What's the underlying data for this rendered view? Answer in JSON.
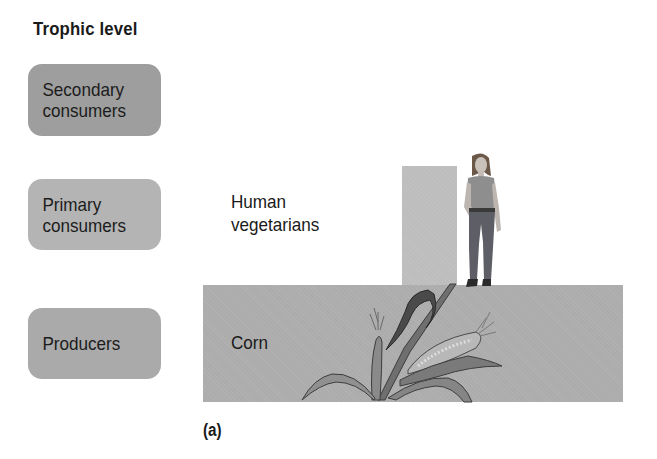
{
  "title": "Trophic level",
  "levels": [
    {
      "id": "secondary",
      "label": "Secondary consumers",
      "lines": [
        "Secondary",
        "consumers"
      ]
    },
    {
      "id": "primary",
      "label": "Primary consumers",
      "lines": [
        "Primary",
        "consumers"
      ]
    },
    {
      "id": "producers",
      "label": "Producers",
      "lines": [
        "Producers"
      ]
    }
  ],
  "pyramid": {
    "primary_consumers_label_lines": [
      "Human",
      "vegetarians"
    ],
    "producers_label": "Corn"
  },
  "panel_label": "(a)",
  "colors": {
    "secondary_box": "#9e9e9e",
    "primary_box": "#b4b4b4",
    "producers_box": "#aaaaaa",
    "producers_bar": "#acacac",
    "primary_bar": "#bdbdbd"
  }
}
